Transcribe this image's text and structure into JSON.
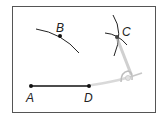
{
  "figure": {
    "type": "geometric-construction",
    "points": {
      "A": {
        "label": "A"
      },
      "B": {
        "label": "B"
      },
      "C": {
        "label": "C"
      },
      "D": {
        "label": "D"
      }
    },
    "segments": [
      {
        "from": "A",
        "to": "D"
      }
    ],
    "arcs": [
      "arc-through-B",
      "arc-through-C-1",
      "arc-through-C-2"
    ],
    "tool": "compass",
    "colors": {
      "stroke": "#111111",
      "frame": "#555555",
      "compass": "#c8c8c8"
    }
  }
}
